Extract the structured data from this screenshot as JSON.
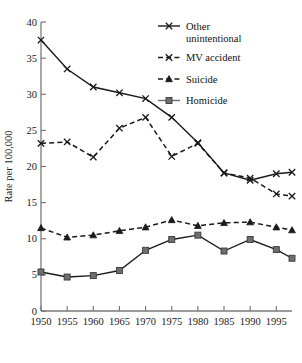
{
  "chart_data": {
    "type": "line",
    "title": "",
    "xlabel": "",
    "ylabel": "Rate per 100,000",
    "x": [
      1950,
      1955,
      1960,
      1965,
      1970,
      1975,
      1980,
      1985,
      1990,
      1995,
      1998
    ],
    "xtick_labels": [
      "1950",
      "1955",
      "1960",
      "1965",
      "1970",
      "1975",
      "1980",
      "1985",
      "1990",
      "1995"
    ],
    "ytick_labels": [
      "0",
      "5",
      "10",
      "15",
      "20",
      "25",
      "30",
      "35",
      "40"
    ],
    "ylim": [
      0,
      40
    ],
    "ytick_step": 5,
    "grid": false,
    "legend_position": "top-right",
    "series": [
      {
        "name": "Other unintentional",
        "style": "solid",
        "marker": "x",
        "color": "#1a1a1a",
        "values": [
          37.5,
          33.5,
          31.0,
          30.2,
          29.4,
          26.8,
          23.3,
          19.1,
          18.1,
          19.0,
          19.2
        ]
      },
      {
        "name": "MV accident",
        "style": "dashed",
        "marker": "x",
        "color": "#1a1a1a",
        "values": [
          23.2,
          23.4,
          21.3,
          25.3,
          26.8,
          21.4,
          23.2,
          19.1,
          18.4,
          16.2,
          15.9
        ]
      },
      {
        "name": "Suicide",
        "style": "dashed",
        "marker": "triangle",
        "color": "#1a1a1a",
        "values": [
          11.5,
          10.2,
          10.5,
          11.1,
          11.6,
          12.6,
          11.8,
          12.2,
          12.3,
          11.6,
          11.2
        ]
      },
      {
        "name": "Homicide",
        "style": "solid",
        "marker": "square",
        "color": "#6e6e6e",
        "values": [
          5.4,
          4.7,
          4.9,
          5.6,
          8.4,
          9.9,
          10.5,
          8.3,
          9.9,
          8.5,
          7.3
        ]
      }
    ]
  },
  "legend": {
    "items": [
      {
        "label_line1": "Other",
        "label_line2": "unintentional"
      },
      {
        "label_line1": "MV accident",
        "label_line2": ""
      },
      {
        "label_line1": "Suicide",
        "label_line2": ""
      },
      {
        "label_line1": "Homicide",
        "label_line2": ""
      }
    ]
  }
}
